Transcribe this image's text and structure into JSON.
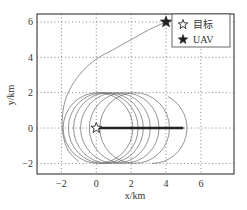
{
  "chart_data": {
    "type": "line",
    "title": "",
    "xlabel": "x/km",
    "ylabel": "y/km",
    "xlim": [
      -3.4,
      7.9
    ],
    "ylim": [
      -2.6,
      6.45
    ],
    "xticks": [
      -2,
      0,
      2,
      4,
      6
    ],
    "yticks": [
      -2,
      0,
      2,
      4,
      6
    ],
    "xtick_labels": [
      "−2",
      "0",
      "2",
      "4",
      "6"
    ],
    "ytick_labels": [
      "−2",
      "0",
      "2",
      "4",
      "6"
    ],
    "grid": true,
    "grid_style": "dotted",
    "legend_position": "upper right",
    "legend": [
      {
        "label": "目标",
        "marker": "open-star"
      },
      {
        "label": "UAV",
        "marker": "filled-star"
      }
    ],
    "points": {
      "target": {
        "label": "目标",
        "x": 0,
        "y": 0
      },
      "uav": {
        "label": "UAV",
        "x": 4,
        "y": 6
      }
    },
    "series": [
      {
        "name": "UAV approach trajectory",
        "x": [
          4.0,
          3.0,
          2.0,
          1.0,
          0.0,
          -0.8,
          -1.4,
          -1.8,
          -1.95,
          -1.9,
          -1.6,
          -1.0
        ],
        "y": [
          6.0,
          5.55,
          5.0,
          4.45,
          3.9,
          3.2,
          2.4,
          1.5,
          0.5,
          -0.4,
          -1.3,
          -1.9
        ]
      },
      {
        "name": "Target track",
        "x": [
          0,
          5
        ],
        "y": [
          0,
          0
        ]
      }
    ],
    "loiter_circles": {
      "radius_km": 2,
      "center_y": 0,
      "centers_x": [
        0.1,
        0.4,
        0.7,
        1.1,
        1.6,
        2.2,
        3.2
      ],
      "last_is_partial": true
    }
  }
}
